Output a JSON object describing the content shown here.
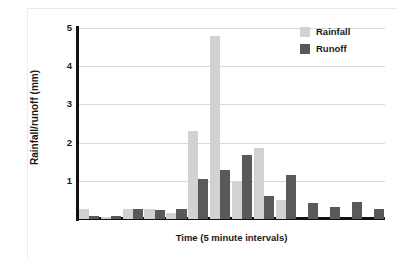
{
  "figure": {
    "background_color": "#ffffff"
  },
  "chart_data": {
    "type": "bar",
    "title": "",
    "xlabel": "Time (5 minute intervals)",
    "ylabel": "Rainfall/runoff (mm)",
    "ylim": [
      0,
      5
    ],
    "yticks": [
      1,
      2,
      3,
      4,
      5
    ],
    "ytick_labels": [
      "1",
      "2",
      "3",
      "4",
      "5"
    ],
    "xtick_labels": [],
    "grid": "horizontal",
    "legend_position": "top-right",
    "colors": {
      "rainfall": "#d2d2d2",
      "runoff": "#595959",
      "axis": "#111111",
      "gridline": "#d9d9d9",
      "text": "#1a1a1a"
    },
    "categories": [
      "1",
      "2",
      "3",
      "4",
      "5",
      "6",
      "7",
      "8",
      "9",
      "10",
      "11",
      "12",
      "13",
      "14"
    ],
    "series": [
      {
        "name": "Rainfall",
        "color": "#d2d2d2",
        "values": [
          0.25,
          0.05,
          0.25,
          0.27,
          0.15,
          2.3,
          4.78,
          0.97,
          1.86,
          0.5,
          0.0,
          0.0,
          0.0,
          0.0
        ]
      },
      {
        "name": "Runoff",
        "color": "#595959",
        "values": [
          0.07,
          0.07,
          0.25,
          0.24,
          0.27,
          1.06,
          1.29,
          1.68,
          0.59,
          1.16,
          0.43,
          0.32,
          0.44,
          0.27
        ]
      }
    ]
  },
  "legend": {
    "items": [
      {
        "label": "Rainfall",
        "color": "#d2d2d2"
      },
      {
        "label": "Runoff",
        "color": "#595959"
      }
    ]
  }
}
